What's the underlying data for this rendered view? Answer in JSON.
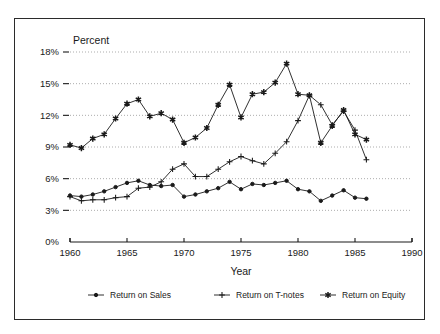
{
  "chart_data": {
    "type": "line",
    "title": "",
    "xlabel": "Year",
    "ylabel": "Percent",
    "xlim": [
      1960,
      1990
    ],
    "ylim": [
      0,
      18
    ],
    "xticks": [
      1960,
      1965,
      1970,
      1975,
      1980,
      1985,
      1990
    ],
    "xtick_labels": [
      "1960",
      "1965",
      "1970",
      "1975",
      "1980",
      "1985",
      "1990"
    ],
    "yticks": [
      0,
      3,
      6,
      9,
      12,
      15,
      18
    ],
    "ytick_labels": [
      "0%",
      "3%",
      "6%",
      "9%",
      "12%",
      "15%",
      "18%"
    ],
    "grid": "horizontal-dotted",
    "legend_position": "bottom-outside",
    "x": [
      1960,
      1961,
      1962,
      1963,
      1964,
      1965,
      1966,
      1967,
      1968,
      1969,
      1970,
      1971,
      1972,
      1973,
      1974,
      1975,
      1976,
      1977,
      1978,
      1979,
      1980,
      1981,
      1982,
      1983,
      1984,
      1985,
      1986
    ],
    "series": [
      {
        "name": "Return on Sales",
        "marker": "dot",
        "values": [
          4.4,
          4.3,
          4.5,
          4.8,
          5.2,
          5.6,
          5.8,
          5.4,
          5.3,
          5.4,
          4.3,
          4.5,
          4.8,
          5.1,
          5.7,
          5.0,
          5.5,
          5.4,
          5.6,
          5.8,
          5.0,
          4.8,
          3.9,
          4.4,
          4.9,
          4.2,
          4.1
        ]
      },
      {
        "name": "Return on T-notes",
        "marker": "plus",
        "values": [
          4.3,
          3.9,
          4.0,
          4.0,
          4.2,
          4.3,
          5.1,
          5.2,
          5.7,
          6.9,
          7.4,
          6.2,
          6.2,
          6.9,
          7.6,
          8.1,
          7.7,
          7.4,
          8.4,
          9.5,
          11.5,
          13.9,
          13.0,
          11.1,
          12.4,
          10.6,
          7.8
        ]
      },
      {
        "name": "Return on Equity",
        "marker": "star",
        "values": [
          9.2,
          8.9,
          9.8,
          10.2,
          11.7,
          13.1,
          13.5,
          11.9,
          12.2,
          11.6,
          9.4,
          9.9,
          10.8,
          13.0,
          14.9,
          11.8,
          14.0,
          14.2,
          15.1,
          16.9,
          14.0,
          13.9,
          9.4,
          11.0,
          12.5,
          10.2,
          9.7
        ]
      }
    ]
  },
  "axes": {
    "y_axis_title": "Percent",
    "x_axis_title": "Year"
  },
  "legend": {
    "items": [
      {
        "label": "Return on Sales",
        "marker": "dot"
      },
      {
        "label": "Return on T-notes",
        "marker": "plus"
      },
      {
        "label": "Return on Equity",
        "marker": "star"
      }
    ]
  },
  "colors": {
    "ink": "#1a1a1a",
    "grid": "#8a8a8a",
    "background": "#ffffff",
    "frame": "#2b2b2b"
  }
}
